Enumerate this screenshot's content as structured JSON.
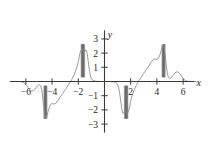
{
  "chart_data": {
    "type": "line",
    "title": "",
    "subtitle": "",
    "xlabel": "x",
    "ylabel": "y",
    "xlim": [
      -7.2,
      7.0
    ],
    "ylim": [
      -3.6,
      3.6
    ],
    "grid": false,
    "legend": null,
    "x_ticks": [
      -6,
      -4,
      -2,
      2,
      4,
      6
    ],
    "x_tick_labels": [
      "−6",
      "−4",
      "−2",
      "2",
      "4",
      "6"
    ],
    "y_ticks": [
      3,
      2,
      1,
      -1,
      -2,
      -3
    ],
    "y_tick_labels": [
      "3",
      "2",
      "1",
      "−1",
      "−2",
      "−3"
    ],
    "series": [
      {
        "name": "f(x)",
        "color": "#8c8c8c",
        "line_width": 0.9,
        "points": [
          [
            -7.2,
            0.0
          ],
          [
            -6.9,
            0.0
          ],
          [
            -6.6,
            0.0
          ],
          [
            -6.4,
            -0.01
          ],
          [
            -6.25,
            -0.04
          ],
          [
            -6.1,
            -0.12
          ],
          [
            -5.95,
            -0.28
          ],
          [
            -5.85,
            -0.42
          ],
          [
            -5.75,
            -0.55
          ],
          [
            -5.65,
            -0.64
          ],
          [
            -5.55,
            -0.68
          ],
          [
            -5.45,
            -0.66
          ],
          [
            -5.35,
            -0.58
          ],
          [
            -5.25,
            -0.46
          ],
          [
            -5.15,
            -0.33
          ],
          [
            -5.05,
            -0.24
          ],
          [
            -4.95,
            -0.22
          ],
          [
            -4.88,
            -0.3
          ],
          [
            -4.8,
            -0.55
          ],
          [
            -4.74,
            -0.95
          ],
          [
            -4.68,
            -1.45
          ],
          [
            -4.62,
            -1.95
          ],
          [
            -4.58,
            -2.3
          ],
          [
            -4.54,
            -2.52
          ],
          [
            -4.5,
            -2.6
          ],
          [
            -4.44,
            -2.55
          ],
          [
            -4.38,
            -2.38
          ],
          [
            -4.3,
            -2.1
          ],
          [
            -4.2,
            -1.8
          ],
          [
            -4.1,
            -1.6
          ],
          [
            -4.0,
            -1.55
          ],
          [
            -3.85,
            -1.6
          ],
          [
            -3.7,
            -1.52
          ],
          [
            -3.55,
            -1.35
          ],
          [
            -3.4,
            -1.12
          ],
          [
            -3.2,
            -0.85
          ],
          [
            -3.0,
            -0.58
          ],
          [
            -2.8,
            -0.3
          ],
          [
            -2.6,
            -0.02
          ],
          [
            -2.45,
            0.22
          ],
          [
            -2.3,
            0.52
          ],
          [
            -2.15,
            0.88
          ],
          [
            -2.05,
            1.18
          ],
          [
            -1.98,
            1.48
          ],
          [
            -1.92,
            1.78
          ],
          [
            -1.86,
            2.02
          ],
          [
            -1.8,
            2.18
          ],
          [
            -1.74,
            2.24
          ],
          [
            -1.68,
            2.2
          ],
          [
            -1.62,
            2.1
          ],
          [
            -1.56,
            2.05
          ],
          [
            -1.5,
            2.1
          ],
          [
            -1.44,
            2.22
          ],
          [
            -1.38,
            2.2
          ],
          [
            -1.32,
            1.95
          ],
          [
            -1.26,
            1.55
          ],
          [
            -1.2,
            1.1
          ],
          [
            -1.14,
            0.72
          ],
          [
            -1.08,
            0.44
          ],
          [
            -1.02,
            0.26
          ],
          [
            -0.96,
            0.15
          ],
          [
            -0.88,
            0.08
          ],
          [
            -0.78,
            0.04
          ],
          [
            -0.66,
            0.02
          ],
          [
            -0.5,
            0.01
          ],
          [
            -0.3,
            0.0
          ],
          [
            -0.1,
            0.0
          ],
          [
            0.0,
            0.0
          ],
          [
            0.1,
            0.0
          ],
          [
            0.3,
            0.0
          ],
          [
            0.5,
            -0.01
          ],
          [
            0.66,
            -0.02
          ],
          [
            0.78,
            -0.04
          ],
          [
            0.88,
            -0.08
          ],
          [
            0.96,
            -0.15
          ],
          [
            1.02,
            -0.26
          ],
          [
            1.08,
            -0.44
          ],
          [
            1.14,
            -0.72
          ],
          [
            1.2,
            -1.1
          ],
          [
            1.26,
            -1.55
          ],
          [
            1.32,
            -1.95
          ],
          [
            1.38,
            -2.2
          ],
          [
            1.44,
            -2.22
          ],
          [
            1.5,
            -2.1
          ],
          [
            1.56,
            -2.05
          ],
          [
            1.62,
            -2.1
          ],
          [
            1.68,
            -2.2
          ],
          [
            1.74,
            -2.24
          ],
          [
            1.8,
            -2.18
          ],
          [
            1.86,
            -2.02
          ],
          [
            1.92,
            -1.78
          ],
          [
            1.98,
            -1.48
          ],
          [
            2.05,
            -1.18
          ],
          [
            2.15,
            -0.88
          ],
          [
            2.3,
            -0.52
          ],
          [
            2.45,
            -0.22
          ],
          [
            2.6,
            0.02
          ],
          [
            2.8,
            0.3
          ],
          [
            3.0,
            0.58
          ],
          [
            3.2,
            0.85
          ],
          [
            3.4,
            1.12
          ],
          [
            3.55,
            1.35
          ],
          [
            3.7,
            1.52
          ],
          [
            3.85,
            1.6
          ],
          [
            4.0,
            1.55
          ],
          [
            4.1,
            1.6
          ],
          [
            4.2,
            1.8
          ],
          [
            4.3,
            2.1
          ],
          [
            4.38,
            2.38
          ],
          [
            4.44,
            2.55
          ],
          [
            4.5,
            2.6
          ],
          [
            4.54,
            2.52
          ],
          [
            4.58,
            2.3
          ],
          [
            4.62,
            1.95
          ],
          [
            4.68,
            1.45
          ],
          [
            4.74,
            0.95
          ],
          [
            4.8,
            0.55
          ],
          [
            4.88,
            0.3
          ],
          [
            4.95,
            0.22
          ],
          [
            5.05,
            0.24
          ],
          [
            5.15,
            0.33
          ],
          [
            5.25,
            0.46
          ],
          [
            5.35,
            0.58
          ],
          [
            5.45,
            0.66
          ],
          [
            5.55,
            0.68
          ],
          [
            5.65,
            0.64
          ],
          [
            5.75,
            0.55
          ],
          [
            5.85,
            0.42
          ],
          [
            5.95,
            0.28
          ],
          [
            6.1,
            0.12
          ],
          [
            6.25,
            0.04
          ],
          [
            6.4,
            0.01
          ],
          [
            6.6,
            0.0
          ],
          [
            6.9,
            0.0
          ],
          [
            7.0,
            0.0
          ]
        ]
      }
    ],
    "oscillation_bands": [
      {
        "name": "band-upper-left",
        "x_min": -1.78,
        "x_max": -1.52,
        "y_min": 0.3,
        "y_max": 2.62
      },
      {
        "name": "band-lower-left",
        "x_min": -4.62,
        "x_max": -4.4,
        "y_min": -2.62,
        "y_max": -0.3
      },
      {
        "name": "band-lower-right",
        "x_min": 1.52,
        "x_max": 1.78,
        "y_min": -2.62,
        "y_max": -0.3
      },
      {
        "name": "band-upper-right",
        "x_min": 4.4,
        "x_max": 4.62,
        "y_min": 0.3,
        "y_max": 2.62
      }
    ],
    "band_color": "#7d7d7d",
    "axis_color": "#3a3a3a"
  }
}
